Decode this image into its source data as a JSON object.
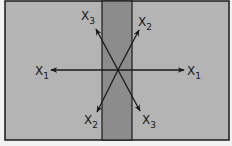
{
  "diagram": {
    "colors": {
      "background": "#f2f2f2",
      "panel": "#b4b4b4",
      "strip": "#8c8c8c",
      "stroke": "#1a1a1a"
    },
    "frame": {
      "x": 5,
      "y": 1,
      "w": 224,
      "h": 139
    },
    "strip": {
      "x": 102,
      "y": 1,
      "w": 30,
      "h": 139
    },
    "center": {
      "x": 118,
      "y": 70
    },
    "arrows": [
      {
        "id": "x1-left",
        "label": "X",
        "subscript": "1",
        "tip": [
          51,
          70
        ]
      },
      {
        "id": "x1-right",
        "label": "X",
        "subscript": "1",
        "tip": [
          184,
          70
        ]
      },
      {
        "id": "x3-up",
        "label": "X",
        "subscript": "3",
        "tip": [
          96,
          29
        ]
      },
      {
        "id": "x2-up",
        "label": "X",
        "subscript": "2",
        "tip": [
          139,
          30
        ]
      },
      {
        "id": "x2-down",
        "label": "X",
        "subscript": "2",
        "tip": [
          97,
          112
        ]
      },
      {
        "id": "x3-down",
        "label": "X",
        "subscript": "3",
        "tip": [
          140,
          111
        ]
      }
    ],
    "labels": {
      "x1_left": {
        "main": "X",
        "sub": "1"
      },
      "x1_right": {
        "main": "X",
        "sub": "1"
      },
      "x3_top": {
        "main": "X",
        "sub": "3"
      },
      "x2_top": {
        "main": "X",
        "sub": "2"
      },
      "x2_bottom": {
        "main": "X",
        "sub": "2"
      },
      "x3_bottom": {
        "main": "X",
        "sub": "3"
      }
    }
  }
}
